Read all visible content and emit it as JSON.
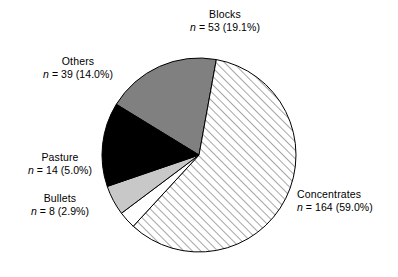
{
  "chart_data": {
    "type": "pie",
    "title": "",
    "categories": [
      "Blocks",
      "Concentrates",
      "Bullets",
      "Pasture",
      "Others"
    ],
    "values": [
      53,
      164,
      8,
      14,
      39
    ],
    "percentages": [
      19.1,
      59.0,
      2.9,
      5.0,
      14.0
    ],
    "total": 278,
    "legend_position": "outside-labels",
    "grid": false,
    "slices": [
      {
        "label": "Blocks",
        "n": 53,
        "percent": 19.1,
        "fill": "#808080",
        "fill_style": "solid-gray",
        "start_angle_deg": 301.5,
        "sweep_deg": 68.8
      },
      {
        "label": "Concentrates",
        "n": 164,
        "percent": 59.0,
        "fill": "#ffffff",
        "fill_style": "diagonal-hatch",
        "start_angle_deg": 10.3,
        "sweep_deg": 212.4
      },
      {
        "label": "Bullets",
        "n": 8,
        "percent": 2.9,
        "fill": "#ffffff",
        "fill_style": "solid-white",
        "start_angle_deg": 222.7,
        "sweep_deg": 10.4
      },
      {
        "label": "Pasture",
        "n": 14,
        "percent": 5.0,
        "fill": "#c8c8c8",
        "fill_style": "solid-light-gray",
        "start_angle_deg": 233.1,
        "sweep_deg": 18.0
      },
      {
        "label": "Others",
        "n": 39,
        "percent": 14.0,
        "fill": "#000000",
        "fill_style": "solid-black",
        "start_angle_deg": 251.1,
        "sweep_deg": 50.4
      }
    ]
  },
  "labels": {
    "blocks": {
      "name": "Blocks",
      "n_symbol": "n",
      "stat": "= 53 (19.1%)"
    },
    "concentrates": {
      "name": "Concentrates",
      "n_symbol": "n",
      "stat": "= 164 (59.0%)"
    },
    "bullets": {
      "name": "Bullets",
      "n_symbol": "n",
      "stat": "= 8 (2.9%)"
    },
    "pasture": {
      "name": "Pasture",
      "n_symbol": "n",
      "stat": "= 14 (5.0%)"
    },
    "others": {
      "name": "Others",
      "n_symbol": "n",
      "stat": "= 39 (14.0%)"
    }
  },
  "geometry": {
    "center_x": 199,
    "center_y": 155,
    "radius": 97
  },
  "colors": {
    "outline": "#000000",
    "background": "#ffffff",
    "blocks_gray": "#808080",
    "pasture_gray": "#c8c8c8",
    "others_black": "#000000"
  }
}
